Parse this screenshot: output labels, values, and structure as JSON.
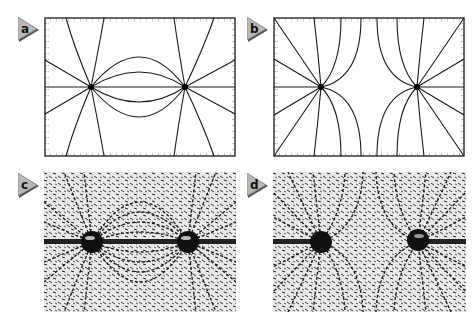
{
  "figure": {
    "panels": [
      {
        "id": "a",
        "label": "a",
        "kind": "field-line-plot",
        "description": "Field lines between two opposite charges (dipole)"
      },
      {
        "id": "b",
        "label": "b",
        "kind": "field-line-plot",
        "description": "Field lines between two like charges"
      },
      {
        "id": "c",
        "label": "c",
        "kind": "photo",
        "description": "Iron filings / seed pattern for opposite charges"
      },
      {
        "id": "d",
        "label": "d",
        "kind": "photo",
        "description": "Iron filings / seed pattern for like charges"
      }
    ],
    "colors": {
      "line": "#1a1a1a",
      "tag_fill": "#b8b8b8",
      "tag_shadow": "#555555",
      "photo_bg": "#e9e9e9",
      "filings": "#1e1e1e"
    }
  }
}
